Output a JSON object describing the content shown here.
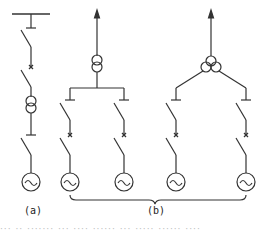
{
  "diagram": {
    "type": "single-line electrical connection diagram",
    "stroke_color": "#333333",
    "background": "#ffffff",
    "panels": [
      {
        "label": "(a)",
        "elements": [
          "busbar",
          "disconnector",
          "circuit-breaker",
          "two-winding-transformer",
          "disconnector",
          "switch",
          "generator"
        ]
      },
      {
        "label": "(b)",
        "subdiagrams": [
          {
            "elements": [
              "output-arrow",
              "two-winding-transformer",
              "bus-split",
              "disconnector x2",
              "circuit-breaker x2",
              "switch x2",
              "generator x2"
            ]
          },
          {
            "elements": [
              "output-arrow",
              "three-winding-transformer",
              "bus-split",
              "disconnector x2",
              "circuit-breaker x2",
              "switch x2",
              "generator x2"
            ]
          }
        ]
      }
    ],
    "caption_fragment": "··· ·· ·······  ··· ····  ······ ··· ····· ······ ····"
  }
}
